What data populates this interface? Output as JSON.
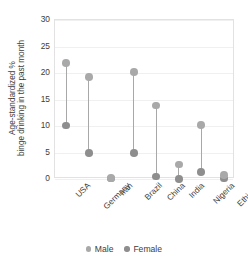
{
  "chart_data": {
    "type": "scatter",
    "title": "",
    "subtitle": "",
    "xlabel": "",
    "ylabel": "Age-standardized %\nbinge drinking in the past month",
    "ylabel_line1": "Age-standardized %",
    "ylabel_line2": "binge drinking in the past month",
    "categories": [
      "USA",
      "Germany",
      "Iran",
      "Brazil",
      "China",
      "India",
      "Nigeria",
      "Ethiopia"
    ],
    "series": [
      {
        "name": "Male",
        "color": "#a9a9a9",
        "values": [
          21.9,
          19.3,
          0.2,
          20.2,
          13.9,
          2.7,
          10.2,
          0.7
        ]
      },
      {
        "name": "Female",
        "color": "#8e8e8e",
        "values": [
          10.1,
          4.9,
          0.1,
          4.9,
          0.5,
          0.0,
          1.3,
          0.1
        ]
      }
    ],
    "ylim": [
      0,
      30
    ],
    "yticks": [
      0,
      5,
      10,
      15,
      20,
      25,
      30
    ],
    "ytick_labels": [
      "0",
      "5",
      "10",
      "15",
      "20",
      "25",
      "30"
    ],
    "grid": true,
    "grid_axis": "y",
    "legend_position": "bottom",
    "legend_entries": [
      "Male",
      "Female"
    ],
    "connector_color": "#a8a8a8",
    "panel_border_color": "#e2e2e2",
    "background_color": "#ffffff"
  }
}
